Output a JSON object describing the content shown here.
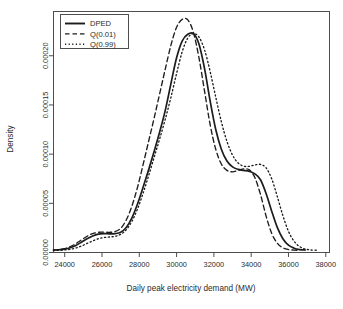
{
  "chart_data": {
    "type": "line",
    "title": "",
    "xlabel": "Daily peak electricity demand  (MW)",
    "ylabel": "Density",
    "xlim": [
      23400,
      38200
    ],
    "ylim": [
      0,
      0.000245
    ],
    "xticks": [
      24000,
      26000,
      28000,
      30000,
      32000,
      34000,
      36000,
      38000
    ],
    "xticklabels": [
      "24000",
      "26000",
      "28000",
      "30000",
      "32000",
      "34000",
      "36000",
      "38000"
    ],
    "yticks": [
      0.0,
      5e-05,
      0.0001,
      0.00015,
      0.0002
    ],
    "yticklabels": [
      "0.00000",
      "0.00005",
      "0.00010",
      "0.00015",
      "0.00020"
    ],
    "grid": false,
    "legend_position": "top-left",
    "legend": [
      "DPED",
      "Q(0.01)",
      "Q(0.99)"
    ],
    "series": [
      {
        "name": "DPED",
        "style": "solid",
        "color": "#1c1c1c",
        "x": [
          23400,
          23700,
          24000,
          24300,
          24600,
          24900,
          25200,
          25500,
          25800,
          26100,
          26400,
          26700,
          27000,
          27300,
          27600,
          27900,
          28200,
          28500,
          28800,
          29100,
          29400,
          29700,
          30000,
          30300,
          30600,
          30900,
          31200,
          31500,
          31800,
          32100,
          32400,
          32700,
          33000,
          33300,
          33600,
          33900,
          34200,
          34500,
          34800,
          35100,
          35400,
          35700,
          36000,
          36300,
          36600,
          36900
        ],
        "y": [
          2.5e-06,
          2.8e-06,
          3.4e-06,
          4.8e-06,
          7.2e-06,
          1.05e-05,
          1.4e-05,
          1.68e-05,
          1.86e-05,
          1.92e-05,
          1.9e-05,
          1.92e-05,
          2.05e-05,
          2.55e-05,
          3.5e-05,
          4.9e-05,
          6.6e-05,
          8.4e-05,
          0.000103,
          0.000123,
          0.000145,
          0.000172,
          0.000198,
          0.000215,
          0.0002218,
          0.0002225,
          0.000212,
          0.000187,
          0.000154,
          0.000125,
          0.000105,
          9.3e-05,
          8.7e-05,
          8.45e-05,
          8.35e-05,
          8.25e-05,
          8e-05,
          7.4e-05,
          6e-05,
          4.2e-05,
          2.55e-05,
          1.4e-05,
          7.5e-06,
          4.4e-06,
          3e-06,
          2.5e-06
        ]
      },
      {
        "name": "Q(0.01)",
        "style": "dashed",
        "color": "#1c1c1c",
        "x": [
          23400,
          23700,
          24000,
          24300,
          24600,
          24900,
          25200,
          25500,
          25800,
          26100,
          26400,
          26700,
          27000,
          27300,
          27600,
          27900,
          28200,
          28500,
          28800,
          29100,
          29400,
          29700,
          30000,
          30300,
          30600,
          30900,
          31200,
          31500,
          31800,
          32100,
          32400,
          32700,
          33000,
          33300,
          33600,
          33900,
          34200,
          34500,
          34800,
          35100,
          35400,
          35700,
          36000,
          36300,
          36600
        ],
        "y": [
          2.6e-06,
          3e-06,
          4e-06,
          6e-06,
          9e-06,
          1.28e-05,
          1.65e-05,
          1.92e-05,
          2.05e-05,
          2.07e-05,
          2.05e-05,
          2.12e-05,
          2.45e-05,
          3.3e-05,
          4.7e-05,
          6.6e-05,
          8.9e-05,
          0.000113,
          0.000137,
          0.000162,
          0.000187,
          0.000211,
          0.000229,
          0.000237,
          0.0002365,
          0.000224,
          0.000198,
          0.000164,
          0.00013,
          0.000105,
          9e-05,
          8.35e-05,
          8.2e-05,
          8.35e-05,
          8.5e-05,
          8.4e-05,
          7.6e-05,
          5.9e-05,
          3.7e-05,
          1.95e-05,
          9.5e-06,
          4.8e-06,
          3e-06,
          2.4e-06,
          2.2e-06
        ]
      },
      {
        "name": "Q(0.99)",
        "style": "dotted",
        "color": "#4a4a4a",
        "x": [
          23400,
          23700,
          24000,
          24300,
          24600,
          24900,
          25200,
          25500,
          25800,
          26100,
          26400,
          26700,
          27000,
          27300,
          27600,
          27900,
          28200,
          28500,
          28800,
          29100,
          29400,
          29700,
          30000,
          30300,
          30600,
          30900,
          31200,
          31500,
          31800,
          32100,
          32400,
          32700,
          33000,
          33300,
          33600,
          33900,
          34200,
          34500,
          34800,
          35100,
          35400,
          35700,
          36000,
          36300,
          36600,
          36900,
          37200,
          37500
        ],
        "y": [
          2e-06,
          2.2e-06,
          2.6e-06,
          3.3e-06,
          4.6e-06,
          6.6e-06,
          9.2e-06,
          1.18e-05,
          1.4e-05,
          1.52e-05,
          1.58e-05,
          1.65e-05,
          1.85e-05,
          2.3e-05,
          3.15e-05,
          4.4e-05,
          6e-05,
          7.8e-05,
          9.7e-05,
          0.000116,
          0.000136,
          0.000158,
          0.000182,
          0.000204,
          0.000218,
          0.0002225,
          0.000219,
          0.000206,
          0.000184,
          0.000158,
          0.000133,
          0.000113,
          9.9e-05,
          9.1e-05,
          8.78e-05,
          8.76e-05,
          8.9e-05,
          8.95e-05,
          8.6e-05,
          7.5e-05,
          5.7e-05,
          3.75e-05,
          2.15e-05,
          1.15e-05,
          6e-06,
          3.5e-06,
          2.6e-06,
          2.3e-06
        ]
      }
    ]
  },
  "axes": {
    "xlabel": "Daily peak electricity demand  (MW)",
    "ylabel": "Density"
  },
  "legend": {
    "items": [
      {
        "label": "DPED",
        "style": "solid"
      },
      {
        "label": "Q(0.01)",
        "style": "dashed"
      },
      {
        "label": "Q(0.99)",
        "style": "dotted"
      }
    ]
  },
  "colors": {
    "line": "#1c1c1c",
    "axis": "#4d4d4d",
    "text": "#2b2b2b",
    "background": "#ffffff"
  }
}
